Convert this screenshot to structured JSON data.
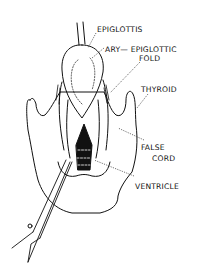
{
  "diagram": {
    "labels": [
      {
        "id": "epiglottis",
        "text": "EPIGLOTTIS"
      },
      {
        "id": "ary-epiglottic-fold-1",
        "text": "ARY— EPIGLOTTIC"
      },
      {
        "id": "ary-epiglottic-fold-2",
        "text": "FOLD"
      },
      {
        "id": "thyroid",
        "text": "THYROID"
      },
      {
        "id": "false-cord-1",
        "text": "FALSE"
      },
      {
        "id": "false-cord-2",
        "text": "CORD"
      },
      {
        "id": "ventricle",
        "text": "VENTRICLE"
      }
    ],
    "colors": {
      "ink": "#111111",
      "background": "#ffffff"
    }
  }
}
